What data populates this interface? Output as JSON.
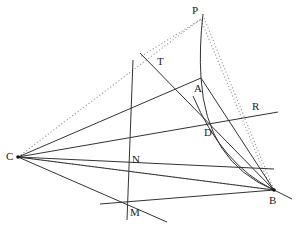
{
  "diagram": {
    "type": "geometry-construction",
    "points": [
      {
        "id": "P",
        "label": "P",
        "x": 202,
        "y": 18,
        "lx": 192,
        "ly": 14
      },
      {
        "id": "A",
        "label": "A",
        "x": 201,
        "y": 78,
        "lx": 194,
        "ly": 92
      },
      {
        "id": "T",
        "label": "T",
        "x": 155,
        "y": 57,
        "lx": 157,
        "ly": 65
      },
      {
        "id": "R",
        "label": "R",
        "x": 256,
        "y": 112,
        "lx": 252,
        "ly": 110
      },
      {
        "id": "D",
        "label": "D",
        "x": 211,
        "y": 125,
        "lx": 204,
        "ly": 136
      },
      {
        "id": "C",
        "label": "C",
        "x": 18,
        "y": 157,
        "lx": 8,
        "ly": 159
      },
      {
        "id": "N",
        "label": "N",
        "x": 130,
        "y": 150,
        "lx": 132,
        "ly": 163
      },
      {
        "id": "M",
        "label": "M",
        "x": 127,
        "y": 201,
        "lx": 130,
        "ly": 216
      },
      {
        "id": "B",
        "label": "B",
        "x": 274,
        "y": 190,
        "lx": 269,
        "ly": 204
      }
    ],
    "solid_lines": [
      {
        "from": [
          18,
          157
        ],
        "to": [
          201,
          78
        ],
        "desc": "C-A"
      },
      {
        "from": [
          18,
          157
        ],
        "to": [
          278,
          112
        ],
        "desc": "C-R line"
      },
      {
        "from": [
          18,
          157
        ],
        "to": [
          274,
          190
        ],
        "desc": "C-B"
      },
      {
        "from": [
          18,
          157
        ],
        "to": [
          167,
          222
        ],
        "desc": "C through M"
      },
      {
        "from": [
          133,
          60
        ],
        "to": [
          127,
          220
        ],
        "desc": "vertical through N and M"
      },
      {
        "from": [
          140,
          53
        ],
        "to": [
          274,
          190
        ],
        "desc": "T-B"
      },
      {
        "from": [
          201,
          78
        ],
        "to": [
          274,
          190
        ],
        "desc": "A-B"
      },
      {
        "from": [
          100,
          205
        ],
        "to": [
          274,
          190
        ],
        "desc": "M-B extended"
      },
      {
        "from": [
          274,
          190
        ],
        "to": [
          292,
          199
        ],
        "desc": "B tail"
      }
    ],
    "curves": [
      {
        "desc": "arc P-A",
        "d": "M202,16 Q199,50 201,78"
      },
      {
        "desc": "arc A-D-B",
        "d": "M201,78 Q205,160 274,190"
      },
      {
        "desc": "arc through D to B",
        "d": "M195,98 Q220,160 274,190"
      }
    ],
    "dotted_lines": [
      {
        "from": [
          18,
          157
        ],
        "to": [
          202,
          18
        ],
        "desc": "C-P"
      },
      {
        "from": [
          202,
          18
        ],
        "to": [
          274,
          190
        ],
        "desc": "P-B outer"
      },
      {
        "from": [
          205,
          18
        ],
        "to": [
          272,
          186
        ],
        "desc": "P-B inner"
      },
      {
        "from": [
          18,
          157
        ],
        "to": [
          274,
          190
        ],
        "desc": "C-B dotted"
      },
      {
        "from": [
          200,
          20
        ],
        "to": [
          140,
          56
        ],
        "desc": "P-T"
      }
    ]
  }
}
